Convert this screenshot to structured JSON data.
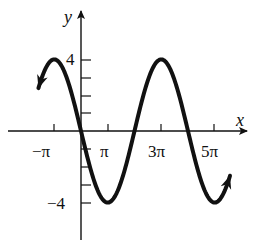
{
  "chart_data": {
    "type": "line",
    "title": "",
    "function": "y = -4 sin(x/2)",
    "xlabel": "x",
    "ylabel": "y",
    "x_ticks": [
      {
        "value": -3.14159,
        "label": "−π"
      },
      {
        "value": 3.14159,
        "label": "π"
      },
      {
        "value": 9.42478,
        "label": "3π"
      },
      {
        "value": 15.70796,
        "label": "5π"
      }
    ],
    "y_ticks": [
      {
        "value": 4,
        "label": "4"
      },
      {
        "value": 3,
        "label": ""
      },
      {
        "value": 2,
        "label": ""
      },
      {
        "value": 1,
        "label": ""
      },
      {
        "value": -1,
        "label": ""
      },
      {
        "value": -2,
        "label": ""
      },
      {
        "value": -3,
        "label": ""
      },
      {
        "value": -4,
        "label": "−4"
      }
    ],
    "key_points": [
      {
        "x": "−π",
        "y": 4,
        "kind": "maximum"
      },
      {
        "x": "0",
        "y": 0,
        "kind": "zero"
      },
      {
        "x": "π",
        "y": -4,
        "kind": "minimum"
      },
      {
        "x": "2π",
        "y": 0,
        "kind": "zero"
      },
      {
        "x": "3π",
        "y": 4,
        "kind": "maximum"
      },
      {
        "x": "4π",
        "y": 0,
        "kind": "zero"
      },
      {
        "x": "5π",
        "y": -4,
        "kind": "minimum"
      }
    ],
    "x_range": [
      -5.0,
      17.5
    ],
    "ylim": [
      -6.0,
      6.2
    ],
    "amplitude": 4,
    "period": "4π",
    "arrows_at_ends": true,
    "grid": false,
    "legend": null
  },
  "labels": {
    "x_axis": "x",
    "y_axis": "y",
    "y_max": "4",
    "y_min": "−4",
    "x_neg_pi": "−π",
    "x_pi": "π",
    "x_3pi": "3π",
    "x_5pi": "5π"
  }
}
